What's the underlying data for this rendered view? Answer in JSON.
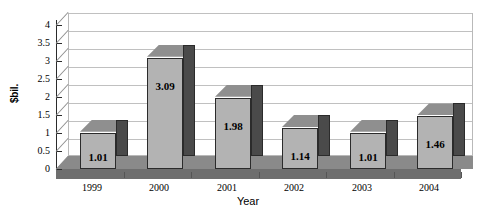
{
  "chart_data": {
    "type": "bar",
    "title": "",
    "xlabel": "Year",
    "ylabel": "$bil.",
    "categories": [
      "1999",
      "2000",
      "2001",
      "2002",
      "2003",
      "2004"
    ],
    "values": [
      1.01,
      3.09,
      1.98,
      1.14,
      1.01,
      1.46
    ],
    "data_labels": [
      "1.01",
      "3.09",
      "1.98",
      "1.14",
      "1.01",
      "1.46"
    ],
    "ylim": [
      0,
      4
    ],
    "yticks": [
      "0",
      "0.5",
      "1",
      "1.5",
      "2",
      "2.5",
      "3",
      "3.5",
      "4"
    ],
    "ytick_values": [
      0,
      0.5,
      1,
      1.5,
      2,
      2.5,
      3,
      3.5,
      4
    ],
    "grid": true,
    "grid_axis": "y",
    "legend": false,
    "style": "3d-column",
    "colors": {
      "bar_front": "#b3b3b3",
      "bar_side": "#4a4a4a",
      "bar_top": "#8f8f8f",
      "floor": "#8a8a8a",
      "floor_front": "#6e6e6e",
      "gridline": "#c0c0c0",
      "axis": "#2b2b2b",
      "text": "#000000",
      "background": "#ffffff"
    }
  }
}
